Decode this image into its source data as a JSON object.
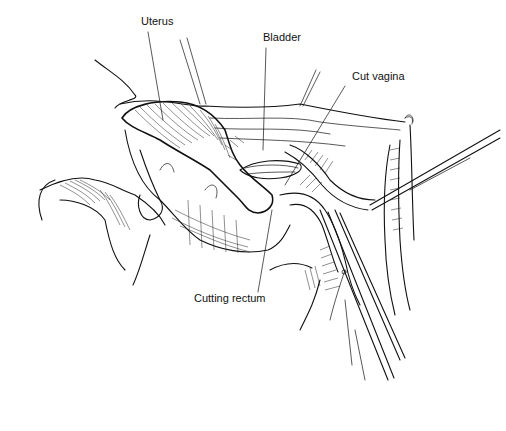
{
  "figure": {
    "type": "surgical line illustration",
    "background": "#ffffff",
    "ink": "#111111"
  },
  "labels": [
    {
      "id": "uterus",
      "text": "Uterus",
      "x": 141,
      "y": 25,
      "leader": [
        [
          148,
          32
        ],
        [
          163,
          120
        ]
      ]
    },
    {
      "id": "bladder",
      "text": "Bladder",
      "x": 263,
      "y": 41,
      "leader": [
        [
          266,
          48
        ],
        [
          263,
          150
        ]
      ]
    },
    {
      "id": "cut_vagina",
      "text": "Cut vagina",
      "x": 352,
      "y": 80,
      "leader": [
        [
          345,
          86
        ],
        [
          285,
          185
        ]
      ]
    },
    {
      "id": "cutting_rectum",
      "text": "Cutting rectum",
      "x": 194,
      "y": 302,
      "leader": [
        [
          258,
          292
        ],
        [
          272,
          210
        ]
      ]
    }
  ]
}
